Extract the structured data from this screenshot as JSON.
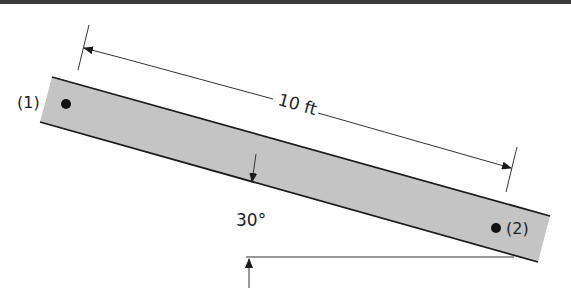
{
  "figure": {
    "length_label": "10 ft",
    "angle_label": "30°",
    "point1_label": "(1)",
    "point2_label": "(2)"
  },
  "colors": {
    "beam_fill": "#c4c4c4",
    "line": "#1a1a1a",
    "top_bar": "#3a3a3a"
  }
}
